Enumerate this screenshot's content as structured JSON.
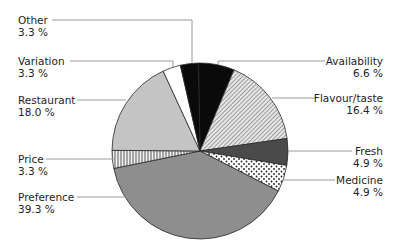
{
  "chart_data": {
    "type": "pie",
    "title": "",
    "unit": "%",
    "start_angle_deg": -1,
    "direction": "clockwise",
    "center": [
      200,
      151
    ],
    "radius": 88,
    "slices": [
      {
        "label": "Availability",
        "value": 6.6,
        "display": "6.6 %",
        "fill": "black"
      },
      {
        "label": "Flavour/taste",
        "value": 16.4,
        "display": "16.4 %",
        "fill": "diag-hatch"
      },
      {
        "label": "Fresh",
        "value": 4.9,
        "display": "4.9 %",
        "fill": "dark-gray"
      },
      {
        "label": "Medicine",
        "value": 4.9,
        "display": "4.9 %",
        "fill": "dots"
      },
      {
        "label": "Preference",
        "value": 39.3,
        "display": "39.3 %",
        "fill": "mid-gray"
      },
      {
        "label": "Price",
        "value": 3.3,
        "display": "3.3 %",
        "fill": "vertical-stripes"
      },
      {
        "label": "Restaurant",
        "value": 18.0,
        "display": "18.0 %",
        "fill": "light-gray"
      },
      {
        "label": "Variation",
        "value": 3.3,
        "display": "3.3 %",
        "fill": "white"
      },
      {
        "label": "Other",
        "value": 3.3,
        "display": "3.3 %",
        "fill": "black"
      }
    ],
    "categories": [
      "Availability",
      "Flavour/taste",
      "Fresh",
      "Medicine",
      "Preference",
      "Price",
      "Restaurant",
      "Variation",
      "Other"
    ],
    "values": [
      6.6,
      16.4,
      4.9,
      4.9,
      39.3,
      3.3,
      18.0,
      3.3,
      3.3
    ],
    "legend": "none (callout labels with leader lines)"
  },
  "labels": {
    "other": {
      "name": "Other",
      "value": "3.3 %"
    },
    "variation": {
      "name": "Variation",
      "value": "3.3 %"
    },
    "restaurant": {
      "name": "Restaurant",
      "value": "18.0 %"
    },
    "price": {
      "name": "Price",
      "value": "3.3 %"
    },
    "preference": {
      "name": "Preference",
      "value": "39.3 %"
    },
    "availability": {
      "name": "Availability",
      "value": "6.6 %"
    },
    "flavour": {
      "name": "Flavour/taste",
      "value": "16.4 %"
    },
    "fresh": {
      "name": "Fresh",
      "value": "4.9 %"
    },
    "medicine": {
      "name": "Medicine",
      "value": "4.9 %"
    }
  },
  "colors": {
    "black": "#0a0a0a",
    "dark-gray": "#4a4a4a",
    "mid-gray": "#8e8e8e",
    "light-gray": "#c4c4c4",
    "white": "#ffffff",
    "outline": "#2a2a2a",
    "leader": "#9a9a9a"
  }
}
